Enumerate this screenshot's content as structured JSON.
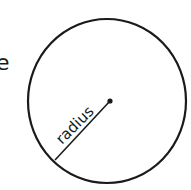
{
  "diagram": {
    "edge_text": "e",
    "circle_label": "radius",
    "stroke_color": "#1a1a1a",
    "background": "#ffffff"
  }
}
